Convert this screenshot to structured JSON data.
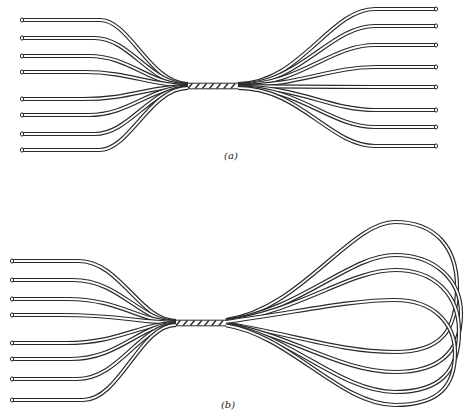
{
  "figure": {
    "panel_a": {
      "label": "(a)",
      "description": "Eight parallel wires twisted together at the center, fanning out to open ends on both sides",
      "left_end_ys": [
        20,
        38,
        56,
        72,
        99,
        115,
        134,
        150
      ],
      "right_end_ys": [
        9,
        26,
        45,
        67,
        87,
        110,
        127,
        146
      ],
      "twist": {
        "x1": 188,
        "x2": 238,
        "y": 86
      }
    },
    "panel_b": {
      "label": "(b)",
      "description": "Eight wires twisted together at the center, open ends on the left and looped back on the right",
      "left_end_ys": [
        261,
        280,
        299,
        315,
        343,
        359,
        379,
        400
      ],
      "twist": {
        "x1": 176,
        "x2": 226,
        "y": 323
      }
    },
    "colors": {
      "line": "#2a2a2a",
      "background": "#ffffff"
    }
  }
}
